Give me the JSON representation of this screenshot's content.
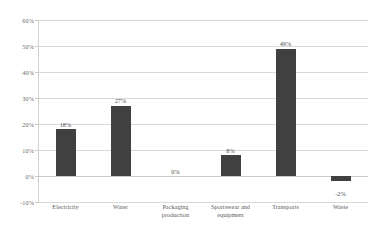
{
  "chart_data": {
    "type": "bar",
    "title": "",
    "subtitle": "",
    "xlabel": "",
    "ylabel": "",
    "categories": [
      "Electricity",
      "Water",
      "Packaging production",
      "Sportswear and equipment",
      "Transports",
      "Waste"
    ],
    "category_lines": [
      [
        "Electricity"
      ],
      [
        "Water"
      ],
      [
        "Packaging",
        "production"
      ],
      [
        "Sportswear and",
        "equipment"
      ],
      [
        "Transports"
      ],
      [
        "Waste"
      ]
    ],
    "values": [
      18,
      27,
      0,
      8,
      49,
      -2
    ],
    "data_labels": [
      "18%",
      "27%",
      "0%",
      "8%",
      "49%",
      "-2%"
    ],
    "ylim": [
      -10,
      60
    ],
    "ytick_values": [
      60,
      50,
      40,
      30,
      20,
      10,
      0,
      -10
    ],
    "ytick_labels": [
      "60%",
      "50%",
      "40%",
      "30%",
      "20%",
      "10%",
      "0%",
      "-10%"
    ],
    "grid": true,
    "grid_axis": "y",
    "legend": false,
    "legend_position": "none",
    "bar_color": "#404040",
    "gridline_color": "#d9d9d9",
    "background_color": "#ffffff",
    "text_color": "#5a5a5a",
    "units": "percent"
  }
}
